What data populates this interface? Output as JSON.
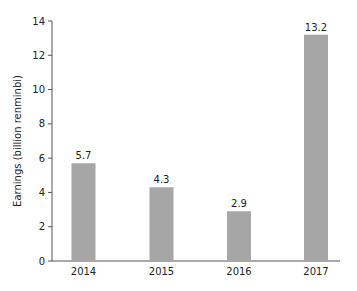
{
  "chart_data": {
    "type": "bar",
    "title": "",
    "xlabel": "",
    "ylabel": "Earnings (billion renminbi)",
    "categories": [
      "2014",
      "2015",
      "2016",
      "2017"
    ],
    "values": [
      5.7,
      4.3,
      2.9,
      13.2
    ],
    "data_labels": [
      "5.7",
      "4.3",
      "2.9",
      "13.2"
    ],
    "ylim": [
      0,
      14
    ],
    "yticks": [
      0,
      2,
      4,
      6,
      8,
      10,
      12,
      14
    ],
    "grid": false,
    "legend": null,
    "bar_color": "#a6a6a6",
    "axis_color": "#555555"
  }
}
